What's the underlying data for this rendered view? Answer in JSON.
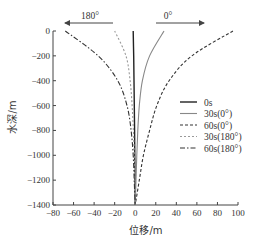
{
  "chart_data": {
    "type": "line",
    "title": "",
    "xlabel": "位移/m",
    "ylabel": "水深/m",
    "xlim": [
      -80,
      100
    ],
    "ylim": [
      -1400,
      0
    ],
    "xticks": [
      -80,
      -60,
      -40,
      -20,
      0,
      20,
      40,
      60,
      80,
      100
    ],
    "xtick_labels": [
      "−80",
      "−60",
      "−40",
      "−20",
      "0",
      "20",
      "40",
      "60",
      "80",
      "100"
    ],
    "yticks": [
      0,
      -200,
      -400,
      -600,
      -800,
      -1000,
      -1200,
      -1400
    ],
    "ytick_labels": [
      "0",
      "−200",
      "−400",
      "−600",
      "−800",
      "−1000",
      "−1200",
      "−1400"
    ],
    "grid": false,
    "legend_position": "right-middle",
    "annotations": [
      {
        "text": "180°",
        "arrow": "left",
        "note": "direction arrow above plot, pointing to negative x"
      },
      {
        "text": "0°",
        "arrow": "right",
        "note": "direction arrow above plot, pointing to positive x"
      }
    ],
    "series": [
      {
        "name": "0s",
        "style": "solid",
        "color": "#222222",
        "depth": [
          0,
          -200,
          -400,
          -600,
          -800,
          -1000,
          -1200,
          -1400
        ],
        "displacement": [
          -2,
          -1.5,
          -1.2,
          -0.9,
          -0.6,
          -0.4,
          -0.2,
          0
        ]
      },
      {
        "name": "30s(0°)",
        "style": "solid",
        "color": "#888888",
        "depth": [
          0,
          -200,
          -400,
          -600,
          -800,
          -1000,
          -1200,
          -1400
        ],
        "displacement": [
          28,
          14,
          7,
          4,
          2.5,
          1.5,
          0.8,
          0
        ]
      },
      {
        "name": "60s(0°)",
        "style": "dashed",
        "color": "#333333",
        "depth": [
          0,
          -200,
          -400,
          -600,
          -800,
          -1000,
          -1200,
          -1400
        ],
        "displacement": [
          95,
          55,
          33,
          21,
          14,
          8,
          4,
          0
        ]
      },
      {
        "name": "30s(180°)",
        "style": "dotted",
        "color": "#999999",
        "depth": [
          0,
          -200,
          -400,
          -600,
          -800,
          -1000,
          -1200,
          -1400
        ],
        "displacement": [
          -20,
          -9,
          -5,
          -3,
          -1.8,
          -1,
          -0.5,
          0
        ]
      },
      {
        "name": "60s(180°)",
        "style": "dashdot",
        "color": "#333333",
        "depth": [
          0,
          -200,
          -400,
          -600,
          -800,
          -1000,
          -1200,
          -1400
        ],
        "displacement": [
          -68,
          -36,
          -17,
          -8,
          -4,
          -2,
          -1,
          0
        ]
      }
    ]
  }
}
